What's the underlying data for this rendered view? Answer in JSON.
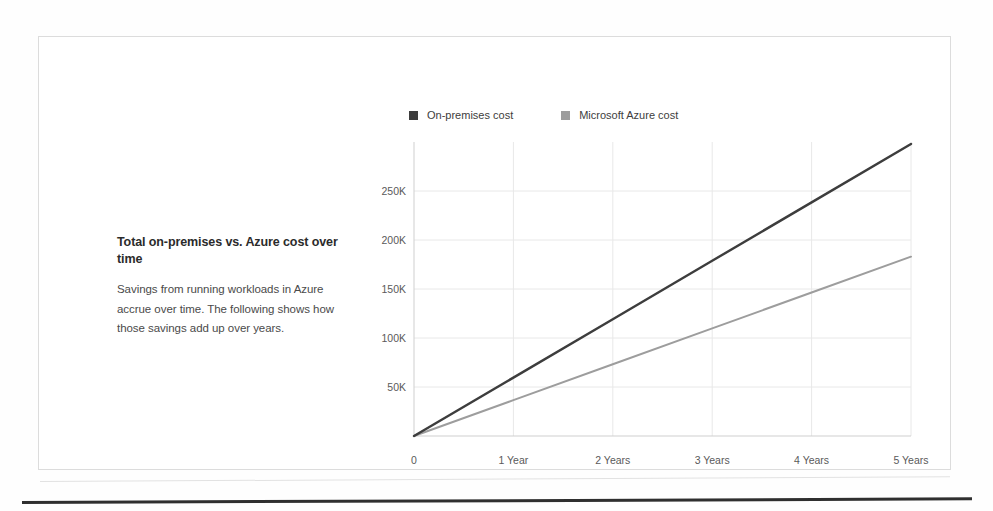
{
  "panel": {
    "heading": "Total on-premises vs. Azure cost over time",
    "body": "Savings from running workloads in Azure accrue over time. The following shows how those savings add up over years."
  },
  "colors": {
    "onpremises": "#3d3d3d",
    "azure": "#9d9d9d",
    "grid": "#e8e8e8",
    "axis": "#cfcfcf",
    "tick_text": "#5a5a5a",
    "frame_border": "#dcdcdc",
    "rule": "#2f2f2f"
  },
  "chart_data": {
    "type": "line",
    "title": "",
    "xlabel": "",
    "ylabel": "",
    "x": [
      0,
      1,
      2,
      3,
      4,
      5
    ],
    "categories": [
      "0",
      "1 Year",
      "2 Years",
      "3 Years",
      "4 Years",
      "5 Years"
    ],
    "xtick_labels": [
      "0",
      "1 Year",
      "2 Years",
      "3 Years",
      "4 Years",
      "5 Years"
    ],
    "ytick_labels": [
      "50K",
      "100K",
      "150K",
      "200K",
      "250K"
    ],
    "ytick_values": [
      50000,
      100000,
      150000,
      200000,
      250000
    ],
    "ylim": [
      0,
      300000
    ],
    "xlim": [
      0,
      5
    ],
    "grid": true,
    "legend_position": "top",
    "series": [
      {
        "name": "On-premises cost",
        "color": "#3d3d3d",
        "values": [
          0,
          59600,
          119200,
          178800,
          238400,
          298000
        ]
      },
      {
        "name": "Microsoft Azure cost",
        "color": "#9d9d9d",
        "values": [
          0,
          36600,
          73200,
          109800,
          146400,
          183000
        ]
      }
    ]
  }
}
